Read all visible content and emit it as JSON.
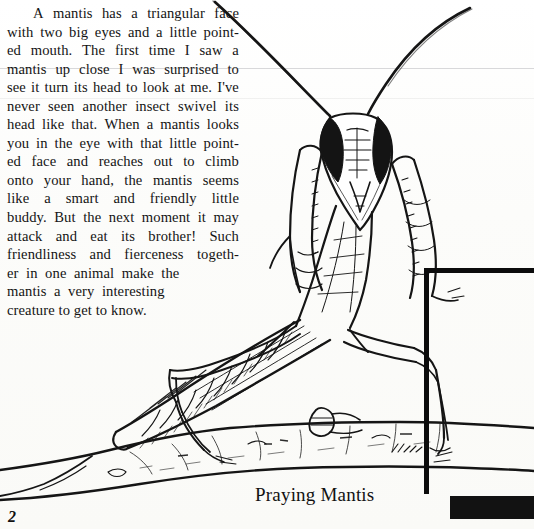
{
  "page": {
    "folio": "2",
    "background_color": "#fbfbf9",
    "ink_color": "#141414"
  },
  "body": {
    "paragraph": "A mantis has a triangular face with two big eyes and a little pointed mouth. The first time I saw a mantis up close I was surprised to see it turn its head to look at me. I've never seen another insect swivel its head like that. When a mantis looks you in the eye with that little pointed face and reaches out to climb onto your hand, the mantis seems like a smart and friendly little buddy. But the next moment it may attack and eat its brother! Such friendliness and fierceness together in one animal make the mantis a very interesting creature to get to know.",
    "lines": [
      "A mantis has a triangular face",
      "with two big eyes and a little point-",
      "ed mouth. The first time I saw a",
      "mantis up close I was surprised to",
      "see it turn its head to look at me. I've",
      "never seen another insect swivel its",
      "head like that. When a mantis looks",
      "you in the eye with that little point-",
      "ed face and reaches out to climb",
      "onto your hand, the mantis seems",
      "like a smart and friendly little",
      "buddy. But the next moment it may",
      "attack and eat its brother! Such",
      "friendliness and fierceness togeth-",
      "er in one animal make the",
      "mantis a very interesting",
      "creature to get to know."
    ]
  },
  "figure": {
    "caption": "Praying Mantis"
  },
  "frame": {
    "border_color": "#0c0c0c",
    "bar_color": "#121212"
  }
}
